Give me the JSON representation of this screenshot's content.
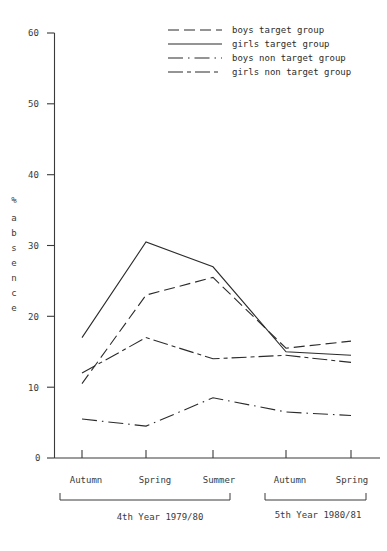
{
  "chart_data": {
    "type": "line",
    "title": "",
    "xlabel": "",
    "ylabel": "% absence",
    "ylim": [
      0,
      60
    ],
    "yticks": [
      0,
      10,
      20,
      30,
      40,
      50,
      60
    ],
    "grid": false,
    "legend_position": "top-right",
    "categories": [
      "Autumn",
      "Spring",
      "Summer",
      "Autumn",
      "Spring"
    ],
    "group_labels": [
      {
        "text": "4th Year 1979/80",
        "categories": [
          "Autumn",
          "Spring",
          "Summer"
        ]
      },
      {
        "text": "5th Year 1980/81",
        "categories": [
          "Autumn",
          "Spring"
        ]
      }
    ],
    "series": [
      {
        "name": "boys  target group",
        "style": "long-dash",
        "values": [
          10.5,
          23.0,
          25.5,
          15.5,
          16.5
        ]
      },
      {
        "name": "girls target group",
        "style": "solid",
        "values": [
          17.0,
          30.5,
          27.0,
          15.0,
          14.5
        ]
      },
      {
        "name": "boys  non target group",
        "style": "dash-dot",
        "values": [
          5.5,
          4.5,
          8.5,
          6.5,
          6.0
        ]
      },
      {
        "name": "girls non target group",
        "style": "dash-dash-dot",
        "values": [
          12.0,
          17.0,
          14.0,
          14.5,
          13.5
        ]
      }
    ]
  },
  "axis": {
    "y_label_chars": [
      "%",
      "a",
      "b",
      "s",
      "e",
      "n",
      "c",
      "e"
    ],
    "y_tick_labels": [
      "60",
      "50",
      "40",
      "30",
      "20",
      "10",
      "0"
    ]
  },
  "legend": {
    "entries": [
      "boys  target group",
      "girls target group",
      "boys  non target group",
      "girls non target group"
    ]
  },
  "x_axis": {
    "tick_labels": [
      "Autumn",
      "Spring",
      "Summer",
      "Autumn",
      "Spring"
    ],
    "group_1": "4th Year 1979/80",
    "group_2": "5th Year 1980/81"
  },
  "colors": {
    "ink": "#2b2b2b",
    "axis": "#3a3a3a",
    "background": "#ffffff"
  }
}
